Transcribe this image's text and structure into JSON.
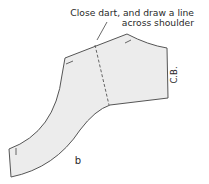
{
  "diagram": {
    "annotation_line1": "Close dart, and draw a line",
    "annotation_line2": "across shoulder",
    "center_back_label": "C.B.",
    "figure_label": "b",
    "colors": {
      "fill": "#ececec",
      "stroke": "#555555",
      "text": "#2a2a2a"
    }
  }
}
